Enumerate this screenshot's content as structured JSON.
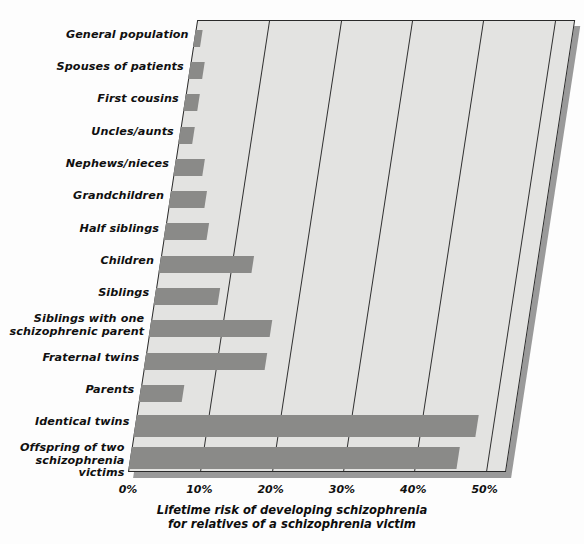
{
  "caption": {
    "line1": "Lifetime risk of developing schizophrenia",
    "line2": "for relatives of a schizophrenia victim"
  },
  "axis": {
    "ticks": [
      "0%",
      "10%",
      "20%",
      "30%",
      "40%",
      "50%"
    ]
  },
  "colors": {
    "bar": "#8a8a88",
    "plot_background": "#e3e3e1",
    "axis_line": "#2a2a2a",
    "page_background": "#fdfdfd",
    "shadow": "#9a9a9a"
  },
  "chart_data": {
    "type": "bar",
    "orientation": "horizontal",
    "title": "Lifetime risk of developing schizophrenia for relatives of a schizophrenia victim",
    "xlabel": "Lifetime risk of developing schizophrenia",
    "ylabel": "",
    "xlim": [
      0,
      53
    ],
    "xticks": [
      0,
      10,
      20,
      30,
      40,
      50
    ],
    "xtick_labels": [
      "0%",
      "10%",
      "20%",
      "30%",
      "40%",
      "50%"
    ],
    "grid": true,
    "legend": false,
    "categories": [
      "General population",
      "Spouses of patients",
      "First cousins",
      "Uncles/aunts",
      "Nephews/nieces",
      "Grandchildren",
      "Half siblings",
      "Children",
      "Siblings",
      "Siblings with one schizophrenic parent",
      "Fraternal twins",
      "Parents",
      "Identical twins",
      "Offspring of two schizophrenia victims"
    ],
    "category_lines": [
      [
        "General population"
      ],
      [
        "Spouses of patients"
      ],
      [
        "First cousins"
      ],
      [
        "Uncles/aunts"
      ],
      [
        "Nephews/nieces"
      ],
      [
        "Grandchildren"
      ],
      [
        "Half siblings"
      ],
      [
        "Children"
      ],
      [
        "Siblings"
      ],
      [
        "Siblings with one",
        "schizophrenic parent"
      ],
      [
        "Fraternal twins"
      ],
      [
        "Parents"
      ],
      [
        "Identical twins"
      ],
      [
        "Offspring of two",
        "schizophrenia victims"
      ]
    ],
    "values": [
      1,
      2,
      2,
      2,
      4,
      5,
      6,
      13,
      9,
      17,
      17,
      6,
      48,
      46
    ],
    "value_labels": [
      "1%",
      "2%",
      "2%",
      "2%",
      "4%",
      "5%",
      "6%",
      "13%",
      "9%",
      "17%",
      "17%",
      "6%",
      "48%",
      "46%"
    ]
  }
}
